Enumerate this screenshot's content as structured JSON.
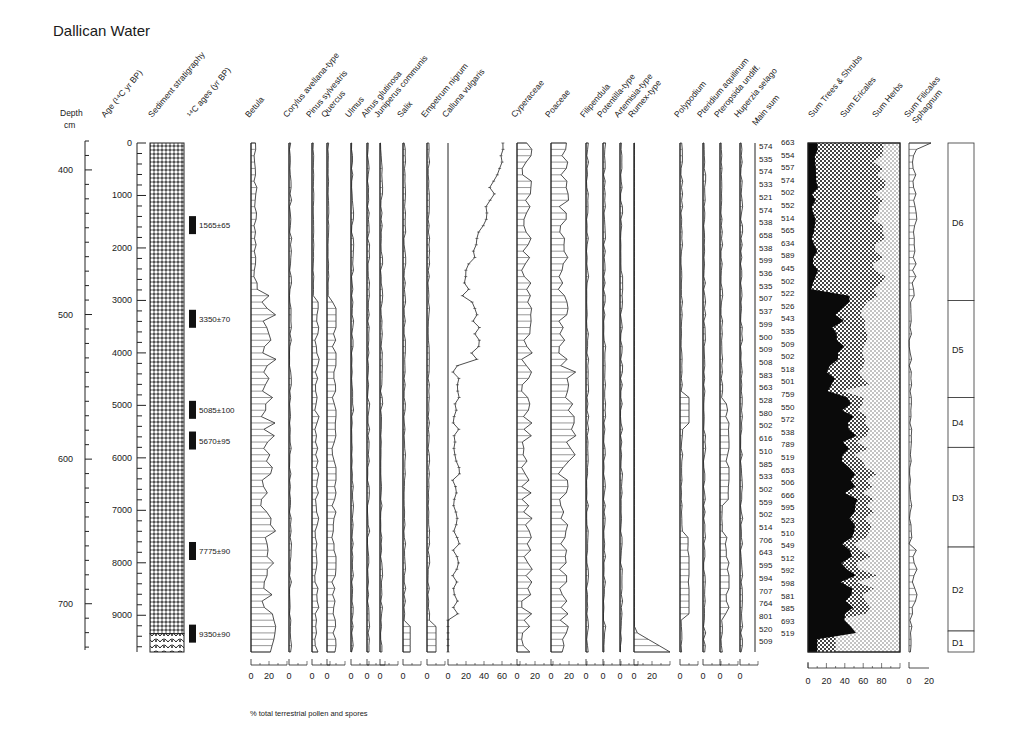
{
  "title": "Dallican Water",
  "footnote": "% total terrestrial pollen and spores",
  "chart_data": {
    "type": "pollen-diagram",
    "title": "Dallican Water",
    "xlabel": "% total terrestrial pollen and spores",
    "depth_axis": {
      "label": "Depth",
      "unit": "cm",
      "ticks": [
        400,
        500,
        600,
        700
      ],
      "range": [
        380,
        732
      ]
    },
    "age_axis": {
      "label": "Age (14C yr BP)",
      "ticks": [
        0,
        1000,
        2000,
        3000,
        4000,
        5000,
        6000,
        7000,
        8000,
        9000
      ],
      "range": [
        0,
        9700
      ]
    },
    "sediment_label": "Sediment stratigraphy",
    "c14_label": "14C ages (yr BP)",
    "c14_dates": [
      {
        "label": "1565±65",
        "age": 1565
      },
      {
        "label": "3350±70",
        "age": 3350
      },
      {
        "label": "5085±100",
        "age": 5085
      },
      {
        "label": "5670±95",
        "age": 5670
      },
      {
        "label": "7775±90",
        "age": 7775
      },
      {
        "label": "9350±90",
        "age": 9350
      }
    ],
    "taxa": [
      {
        "name": "Betula",
        "scale_labels": [
          "0",
          "20"
        ],
        "max": 30
      },
      {
        "name": "Corylus avellana-type",
        "scale_labels": [
          "0"
        ],
        "max": 10
      },
      {
        "name": "Pinus sylvestris",
        "scale_labels": [
          "0"
        ],
        "max": 10
      },
      {
        "name": "Quercus",
        "scale_labels": [
          "0"
        ],
        "max": 10
      },
      {
        "name": "Ulmus",
        "scale_labels": [
          "0"
        ],
        "max": 5
      },
      {
        "name": "Alnus glutinosa",
        "scale_labels": [
          "0"
        ],
        "max": 5
      },
      {
        "name": "Juniperus communis",
        "scale_labels": [
          "0"
        ],
        "max": 10
      },
      {
        "name": "Salix",
        "scale_labels": [
          "0"
        ],
        "max": 10
      },
      {
        "name": "Empetrum nigrum",
        "scale_labels": [
          "0"
        ],
        "max": 10
      },
      {
        "name": "Calluna vulgaris",
        "scale_labels": [
          "0",
          "20",
          "40",
          "60"
        ],
        "max": 80
      },
      {
        "name": "Cyperaceae",
        "scale_labels": [
          "0",
          "20"
        ],
        "max": 30
      },
      {
        "name": "Poaceae",
        "scale_labels": [
          "0",
          "20"
        ],
        "max": 30
      },
      {
        "name": "Filipendula",
        "scale_labels": [
          "0"
        ],
        "max": 5
      },
      {
        "name": "Potentilla-type",
        "scale_labels": [
          "0"
        ],
        "max": 10
      },
      {
        "name": "Artemisia-type",
        "scale_labels": [
          "0"
        ],
        "max": 5
      },
      {
        "name": "Rumex-type",
        "scale_labels": [
          "0",
          "20"
        ],
        "max": 40
      },
      {
        "name": "Polypodium",
        "scale_labels": [
          "0"
        ],
        "max": 10
      },
      {
        "name": "Pteridium aquilinum",
        "scale_labels": [
          "0"
        ],
        "max": 5
      },
      {
        "name": "Pteropsida undiff.",
        "scale_labels": [
          "0"
        ],
        "max": 10
      },
      {
        "name": "Huperzia selago",
        "scale_labels": [
          "0"
        ],
        "max": 5
      }
    ],
    "main_sum_label": "Main sum",
    "main_sum_col1": [
      "574",
      "535",
      "574",
      "533",
      "521",
      "574",
      "538",
      "658",
      "538",
      "599",
      "536",
      "535",
      "507",
      "537",
      "599",
      "500",
      "509",
      "508",
      "583",
      "563",
      "528",
      "580",
      "502",
      "616",
      "510",
      "585",
      "533",
      "502",
      "559",
      "502",
      "514",
      "706",
      "643",
      "595",
      "594",
      "707",
      "764",
      "801",
      "520",
      "509"
    ],
    "main_sum_col2": [
      "663",
      "554",
      "557",
      "574",
      "502",
      "552",
      "514",
      "565",
      "634",
      "589",
      "645",
      "502",
      "522",
      "526",
      "543",
      "535",
      "509",
      "502",
      "518",
      "501",
      "759",
      "550",
      "572",
      "538",
      "789",
      "519",
      "653",
      "506",
      "666",
      "595",
      "523",
      "510",
      "549",
      "512",
      "592",
      "598",
      "581",
      "585",
      "693",
      "519"
    ],
    "summary": {
      "labels": [
        "Sum Trees & Shrubs",
        "Sum Ericales",
        "Sum Herbs"
      ],
      "scale_labels": [
        "0",
        "20",
        "40",
        "60",
        "80"
      ],
      "range": [
        0,
        100
      ]
    },
    "filicales": {
      "labels": [
        "Sum Filicales",
        "Sphagnum"
      ],
      "scale_labels": [
        "0",
        "20"
      ]
    },
    "zones": [
      {
        "name": "D6",
        "top_age": 0,
        "bottom_age": 3000
      },
      {
        "name": "D5",
        "top_age": 3000,
        "bottom_age": 4850
      },
      {
        "name": "D4",
        "top_age": 4850,
        "bottom_age": 5800
      },
      {
        "name": "D3",
        "top_age": 5800,
        "bottom_age": 7700
      },
      {
        "name": "D2",
        "top_age": 7700,
        "bottom_age": 9300
      },
      {
        "name": "D1",
        "top_age": 9300,
        "bottom_age": 9700
      }
    ]
  }
}
